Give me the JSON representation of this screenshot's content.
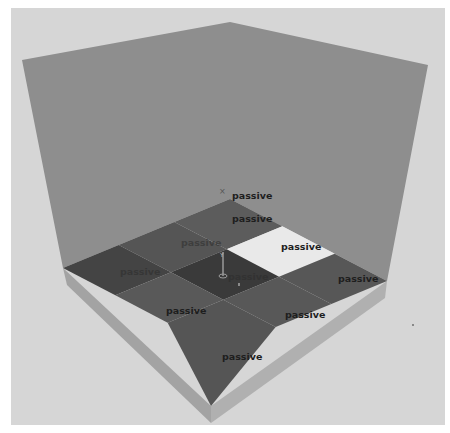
{
  "scene": {
    "background_color": "#ffffff",
    "frame_color": "#d6d6d6",
    "wall_color": "#8e8e8e",
    "floor_base_color": "#a9a9a9",
    "grid_size": [
      3,
      3
    ]
  },
  "grid": {
    "cells": [
      {
        "row": 0,
        "col": 0,
        "state": "passive",
        "color": "#5c5c5c"
      },
      {
        "row": 0,
        "col": 1,
        "state": "passive",
        "color": "#e9e9e9"
      },
      {
        "row": 0,
        "col": 2,
        "state": "passive",
        "color": "#575757"
      },
      {
        "row": 1,
        "col": 0,
        "state": "passive",
        "color": "#555555"
      },
      {
        "row": 1,
        "col": 1,
        "state": "passive",
        "color": "#3a3a3a"
      },
      {
        "row": 1,
        "col": 2,
        "state": "passive",
        "color": "#585858"
      },
      {
        "row": 2,
        "col": 0,
        "state": "passive",
        "color": "#444444"
      },
      {
        "row": 2,
        "col": 1,
        "state": "passive",
        "color": "#595959"
      },
      {
        "row": 2,
        "col": 2,
        "state": "passive",
        "color": "#555555"
      }
    ]
  },
  "labels": {
    "back_marker": "passive",
    "cell_0_0": "passive",
    "cell_0_1": "passive",
    "cell_0_2": "passive",
    "cell_1_0": "passive",
    "cell_1_1": "passive",
    "cell_2_0": "passive",
    "cell_1_2": "passive",
    "cell_2_1": "passive",
    "cell_2_2": "passive"
  },
  "agent": {
    "axis_label": "Y"
  }
}
